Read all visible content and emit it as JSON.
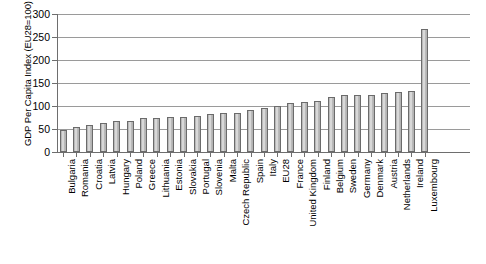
{
  "chart_data": {
    "type": "bar",
    "title": "",
    "xlabel": "",
    "ylabel": "GDP Per Capita Index (EU28=100)",
    "ylim": [
      0,
      300
    ],
    "yticks": [
      0,
      50,
      100,
      150,
      200,
      250,
      300
    ],
    "grid": true,
    "legend": "none",
    "categories": [
      "Bulgaria",
      "Romania",
      "Croatia",
      "Latvia",
      "Hungary",
      "Poland",
      "Greece",
      "Lithuania",
      "Estonia",
      "Slovakia",
      "Portugal",
      "Slovenia",
      "Malta",
      "Czech Republic",
      "Spain",
      "Italy",
      "EU28",
      "France",
      "United Kingdom",
      "Finland",
      "Belgium",
      "Sweden",
      "Germany",
      "Denmark",
      "Austria",
      "Netherlands",
      "Ireland",
      "Luxembourg"
    ],
    "values": [
      47,
      55,
      59,
      64,
      68,
      68,
      73,
      75,
      76,
      77,
      78,
      83,
      85,
      85,
      92,
      96,
      100,
      107,
      109,
      110,
      119,
      124,
      125,
      125,
      129,
      131,
      132,
      267
    ]
  }
}
